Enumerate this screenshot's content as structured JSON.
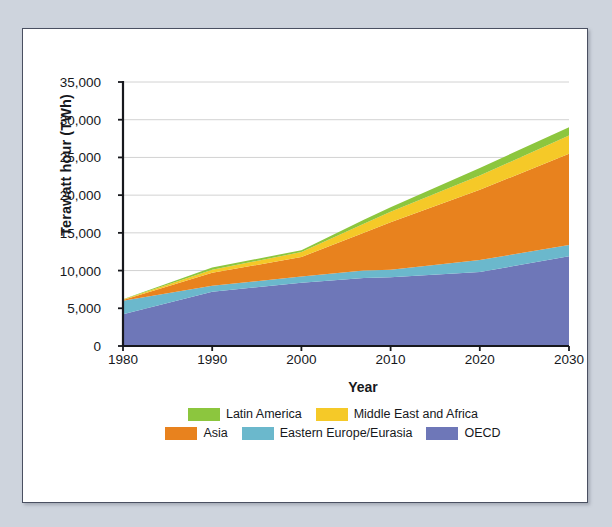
{
  "chart_data": {
    "type": "area",
    "stacked": true,
    "title": "",
    "xlabel": "Year",
    "ylabel": "Terawatt hour (TWh)",
    "x": [
      1980,
      1990,
      2000,
      2007,
      2010,
      2020,
      2030
    ],
    "xlim": [
      1980,
      2030
    ],
    "ylim": [
      0,
      35000
    ],
    "xticks": [
      "1980",
      "1990",
      "2000",
      "2010",
      "2020",
      "2030"
    ],
    "xtick_values": [
      1980,
      1990,
      2000,
      2010,
      2020,
      2030
    ],
    "yticks": [
      "0",
      "5,000",
      "10,000",
      "15,000",
      "20,000",
      "25,000",
      "30,000",
      "35,000"
    ],
    "ytick_values": [
      0,
      5000,
      10000,
      15000,
      20000,
      25000,
      30000,
      35000
    ],
    "grid": "horizontal",
    "legend_position": "bottom",
    "series": [
      {
        "name": "OECD",
        "color": "#6E77B8",
        "values": [
          4200,
          7200,
          8400,
          9000,
          9100,
          9800,
          11900
        ]
      },
      {
        "name": "Eastern Europe/Eurasia",
        "color": "#6BB8CC",
        "values": [
          1800,
          800,
          800,
          1000,
          1000,
          1600,
          1500
        ]
      },
      {
        "name": "Asia",
        "color": "#E8821E",
        "values": [
          100,
          1700,
          2600,
          5000,
          6300,
          9300,
          12100
        ]
      },
      {
        "name": "Middle East and Africa",
        "color": "#F5C928",
        "values": [
          50,
          400,
          650,
          1200,
          1400,
          1900,
          2400
        ]
      },
      {
        "name": "Latin America",
        "color": "#8CC63E",
        "values": [
          50,
          300,
          250,
          550,
          600,
          1000,
          1100
        ]
      }
    ],
    "totals": [
      6200,
      10400,
      12700,
      16750,
      18400,
      23600,
      29000
    ],
    "series_order_bottom_to_top": [
      "OECD",
      "Eastern Europe/Eurasia",
      "Asia",
      "Middle East and Africa",
      "Latin America"
    ]
  },
  "legend": {
    "rows": [
      [
        {
          "label": "Latin America",
          "color": "#8CC63E"
        },
        {
          "label": "Middle East and Africa",
          "color": "#F5C928"
        }
      ],
      [
        {
          "label": "Asia",
          "color": "#E8821E"
        },
        {
          "label": "Eastern Europe/Eurasia",
          "color": "#6BB8CC"
        },
        {
          "label": "OECD",
          "color": "#6E77B8"
        }
      ]
    ]
  },
  "colors": {
    "page_background": "#ced4dd",
    "figure_background": "#ffffff",
    "frame_border": "#4a5061",
    "gridline": "#d2d2d2",
    "axis": "#17181d",
    "text": "#16181c"
  }
}
